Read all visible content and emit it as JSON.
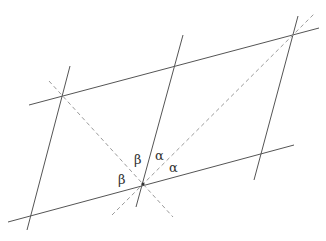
{
  "diagram": {
    "colors": {
      "solid": "#555555",
      "dashed": "#9a9a9a",
      "label": "#333333"
    },
    "solid_lines": [
      {
        "name": "upper-transversal",
        "x1": 29,
        "y1": 105,
        "x2": 319,
        "y2": 28
      },
      {
        "name": "lower-transversal",
        "x1": 8,
        "y1": 222,
        "x2": 294,
        "y2": 145
      },
      {
        "name": "left-parallel",
        "x1": 70,
        "y1": 66,
        "x2": 27,
        "y2": 230
      },
      {
        "name": "middle-parallel",
        "x1": 183,
        "y1": 35,
        "x2": 136,
        "y2": 207
      },
      {
        "name": "right-parallel",
        "x1": 298,
        "y1": 16,
        "x2": 254,
        "y2": 180
      }
    ],
    "dashed_lines": [
      {
        "name": "diagonal-rising",
        "x1": 112,
        "y1": 215,
        "x2": 315,
        "y2": 13
      },
      {
        "name": "diagonal-falling",
        "x1": 49,
        "y1": 81,
        "x2": 173,
        "y2": 217
      }
    ],
    "center_point": {
      "x": 143,
      "y": 184
    },
    "labels": [
      {
        "text": "β",
        "x": 134,
        "y": 164
      },
      {
        "text": "β",
        "x": 118,
        "y": 184
      },
      {
        "text": "α",
        "x": 155,
        "y": 160
      },
      {
        "text": "α",
        "x": 169,
        "y": 172
      }
    ]
  }
}
